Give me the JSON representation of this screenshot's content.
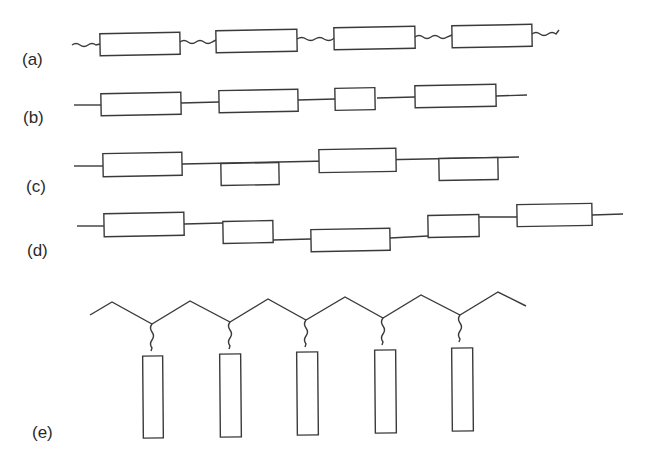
{
  "diagram": {
    "type": "polymer-chain-architectures",
    "colors": {
      "stroke": "#3a3a3a",
      "background": "#ffffff",
      "text": "#2a2a2a"
    },
    "panels": [
      {
        "id": "a",
        "label": "(a)",
        "description": "blocks joined by flexible (wavy) spacers along a line",
        "segments": 4,
        "linker": "wavy"
      },
      {
        "id": "b",
        "label": "(b)",
        "description": "blocks joined by straight links, varying block lengths",
        "segments": 4,
        "linker": "straight"
      },
      {
        "id": "c",
        "label": "(c)",
        "description": "blocks alternating above and below the chain line",
        "segments": 4,
        "linker": "straight"
      },
      {
        "id": "d",
        "label": "(d)",
        "description": "blocks offset at varying heights along a stepped chain",
        "segments": 5,
        "linker": "straight"
      },
      {
        "id": "e",
        "label": "(e)",
        "description": "zig-zag backbone with pendant side-chain blocks attached by wavy spacers",
        "segments": 5,
        "linker": "wavy-pendant"
      }
    ]
  }
}
